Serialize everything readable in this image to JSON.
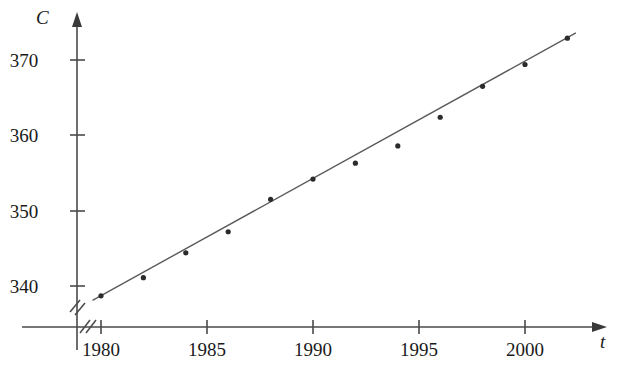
{
  "chart_data": {
    "type": "scatter",
    "title": "",
    "xlabel": "t",
    "ylabel": "C",
    "x": [
      1980,
      1982,
      1984,
      1986,
      1988,
      1990,
      1992,
      1994,
      1996,
      1998,
      2000,
      2002
    ],
    "values": [
      338.7,
      341.1,
      344.4,
      347.2,
      351.5,
      354.2,
      356.3,
      358.6,
      362.4,
      366.5,
      369.4,
      372.9
    ],
    "series": [
      {
        "name": "CO2 concentration (ppm)",
        "values": [
          338.7,
          341.1,
          344.4,
          347.2,
          351.5,
          354.2,
          356.3,
          358.6,
          362.4,
          366.5,
          369.4,
          372.9
        ]
      }
    ],
    "xticks": [
      1980,
      1985,
      1990,
      1995,
      2000
    ],
    "xtick_labels": [
      "1980",
      "1985",
      "1990",
      "1995",
      "2000"
    ],
    "yticks": [
      340,
      350,
      360,
      370
    ],
    "ytick_labels": [
      "340",
      "350",
      "360",
      "370"
    ],
    "xlim": [
      1979,
      2003.5
    ],
    "ylim": [
      336,
      375
    ],
    "grid": false,
    "legend": "none",
    "axis_break_x": true,
    "axis_break_y": true,
    "trendline": {
      "type": "linear",
      "x_start": 1979.6,
      "y_start": 338.1,
      "x_end": 2002.4,
      "y_end": 373.6
    }
  },
  "axes": {
    "y_axis_label": "C",
    "x_axis_label": "t"
  },
  "icons": {
    "y_arrow": "arrow-up-icon",
    "x_arrow": "arrow-right-icon",
    "break": "axis-break-icon"
  }
}
